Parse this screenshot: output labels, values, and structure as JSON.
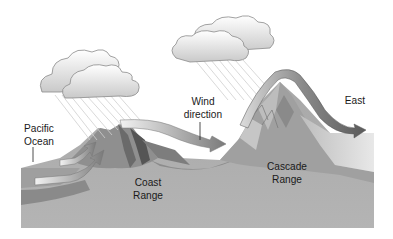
{
  "diagram": {
    "type": "rain-shadow-cross-section",
    "labels": {
      "ocean": [
        "Pacific",
        "Ocean"
      ],
      "coast": [
        "Coast",
        "Range"
      ],
      "wind": [
        "Wind",
        "direction"
      ],
      "cascade": [
        "Cascade",
        "Range"
      ],
      "east": "East"
    },
    "elements": [
      {
        "name": "cloud-left",
        "description": "rain cloud over Pacific coast"
      },
      {
        "name": "cloud-right",
        "description": "rain cloud over Cascade western slope"
      },
      {
        "name": "coast-range",
        "description": "lower mountain range near ocean"
      },
      {
        "name": "cascade-range",
        "description": "tall mountain range inland"
      },
      {
        "name": "wind-arrows",
        "description": "air flowing east over ranges"
      }
    ],
    "colors": {
      "ground": "#a9a9a9",
      "ground_dark": "#8c8c8c",
      "mountain": "#9a9a9a",
      "cloud": "#e8e8e8",
      "cloud_outline": "#888888",
      "arrow_light": "#e6e6e6",
      "arrow_dark": "#6e6e6e",
      "rain": "#c8c8c8"
    }
  }
}
